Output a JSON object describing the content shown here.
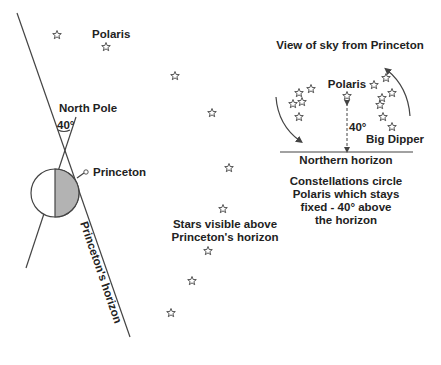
{
  "earth_diagram": {
    "labels": {
      "polaris": "Polaris",
      "north_pole": "North Pole",
      "angle": "40°",
      "princeton": "Princeton",
      "horizon": "Princeton's horizon",
      "stars_visible_line1": "Stars visible above",
      "stars_visible_line2": "Princeton's horizon"
    },
    "stars": [
      {
        "x": 57,
        "y": 35
      },
      {
        "x": 106,
        "y": 47
      },
      {
        "x": 175,
        "y": 76
      },
      {
        "x": 212,
        "y": 113
      },
      {
        "x": 229,
        "y": 168
      },
      {
        "x": 223,
        "y": 209
      },
      {
        "x": 208,
        "y": 251
      },
      {
        "x": 192,
        "y": 281
      },
      {
        "x": 171,
        "y": 313
      }
    ],
    "colors": {
      "earth_shade": "#b3b3b3",
      "line": "#444444"
    }
  },
  "sky_view": {
    "title": "View of sky from Princeton",
    "polaris": "Polaris",
    "angle": "40°",
    "big_dipper": "Big Dipper",
    "horizon": "Northern horizon",
    "caption_lines": [
      "Constellations circle",
      "Polaris which stays",
      "fixed - 40° above",
      "the horizon"
    ],
    "left_stars": [
      {
        "x": 299,
        "y": 93
      },
      {
        "x": 311,
        "y": 89
      },
      {
        "x": 293,
        "y": 104
      },
      {
        "x": 302,
        "y": 102
      },
      {
        "x": 299,
        "y": 117
      }
    ],
    "right_stars": [
      {
        "x": 374,
        "y": 85
      },
      {
        "x": 386,
        "y": 78
      },
      {
        "x": 392,
        "y": 93
      },
      {
        "x": 382,
        "y": 98
      },
      {
        "x": 380,
        "y": 105
      },
      {
        "x": 383,
        "y": 117
      },
      {
        "x": 392,
        "y": 127
      }
    ],
    "polaris_star": {
      "x": 347,
      "y": 96
    }
  }
}
